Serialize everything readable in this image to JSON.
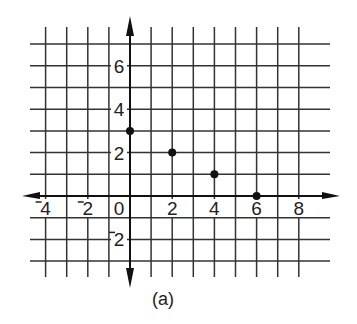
{
  "chart_data": {
    "type": "scatter",
    "title": "",
    "caption": "(a)",
    "xlabel": "",
    "ylabel": "",
    "x": [
      0,
      2,
      4,
      6
    ],
    "y": [
      3,
      2,
      1,
      0
    ],
    "points": [
      {
        "x": 0,
        "y": 3
      },
      {
        "x": 2,
        "y": 2
      },
      {
        "x": 4,
        "y": 1
      },
      {
        "x": 6,
        "y": 0
      }
    ],
    "xlim": [
      -5,
      9
    ],
    "ylim": [
      -3,
      7
    ],
    "grid": true,
    "grid_step": 1,
    "x_tick_labels": [
      "-4",
      "-2",
      "0",
      "2",
      "4",
      "6",
      "8"
    ],
    "y_tick_labels": [
      "6",
      "4",
      "2",
      "-2"
    ],
    "legend": null
  },
  "labels": {
    "caption": "(a)",
    "x_ticks": [
      {
        "value": -4,
        "text": "4",
        "neg": true
      },
      {
        "value": -2,
        "text": "2",
        "neg": true
      },
      {
        "value": 0,
        "text": "0",
        "neg": false
      },
      {
        "value": 2,
        "text": "2",
        "neg": false
      },
      {
        "value": 4,
        "text": "4",
        "neg": false
      },
      {
        "value": 6,
        "text": "6",
        "neg": false
      },
      {
        "value": 8,
        "text": "8",
        "neg": false
      }
    ],
    "y_ticks": [
      {
        "value": 6,
        "text": "6",
        "neg": false
      },
      {
        "value": 4,
        "text": "4",
        "neg": false
      },
      {
        "value": 2,
        "text": "2",
        "neg": false
      },
      {
        "value": -2,
        "text": "2",
        "neg": true
      }
    ]
  }
}
